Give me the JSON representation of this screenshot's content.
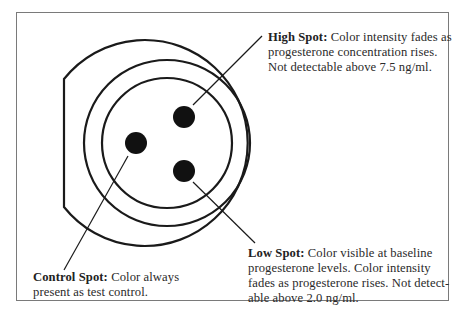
{
  "diagram": {
    "shapes": {
      "outer_ring": "circle with flat left edge",
      "middle_ring": "circle",
      "inner_ring": "circle",
      "spots": [
        "High Spot",
        "Control Spot",
        "Low Spot"
      ]
    }
  },
  "labels": {
    "high": {
      "heading": "High Spot:",
      "line1_rest": " Color intensity fades as",
      "line2": "progesterone concentration rises.",
      "line3": "Not detectable above 7.5 ng/ml."
    },
    "low": {
      "heading": "Low Spot:",
      "line1_rest": " Color visible at baseline",
      "line2": "progesterone levels. Color intensity",
      "line3": "fades as progesterone rises. Not detect-",
      "line4": "able above 2.0 ng/ml."
    },
    "control": {
      "heading": "Control Spot:",
      "line1_rest": " Color always",
      "line2": "present as test control."
    }
  },
  "colors": {
    "stroke": "#1a1a1a",
    "frame": "#7a7a7a",
    "text": "#2a2a2a"
  }
}
